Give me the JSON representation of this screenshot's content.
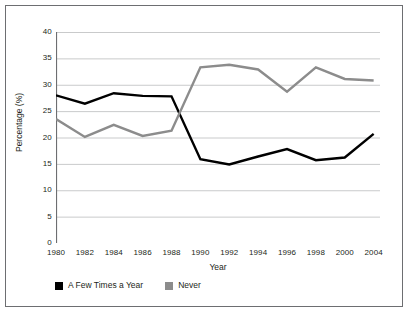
{
  "chart_data": {
    "type": "line",
    "title": "",
    "xlabel": "Year",
    "ylabel": "Percentage (%)",
    "x": [
      1980,
      1982,
      1984,
      1986,
      1988,
      1990,
      1992,
      1994,
      1996,
      1998,
      2000,
      2004
    ],
    "xticklabels": [
      "1980",
      "1982",
      "1984",
      "1986",
      "1988",
      "1990",
      "1992",
      "1994",
      "1996",
      "1998",
      "2000",
      "2004"
    ],
    "yticklabels": [
      "0",
      "5",
      "10",
      "15",
      "20",
      "25",
      "30",
      "35",
      "40"
    ],
    "yticks": [
      0,
      5,
      10,
      15,
      20,
      25,
      30,
      35,
      40
    ],
    "ylim": [
      0,
      40
    ],
    "grid": "horizontal",
    "legend_position": "below-axis-left",
    "series": [
      {
        "name": "A Few Times a Year",
        "color": "#000000",
        "values": [
          28.0,
          26.4,
          28.4,
          27.9,
          27.8,
          15.9,
          14.9,
          16.4,
          17.8,
          15.7,
          16.2,
          20.7
        ]
      },
      {
        "name": "Never",
        "color": "#8c8c8c",
        "values": [
          23.5,
          20.1,
          22.4,
          20.3,
          21.3,
          33.3,
          33.8,
          32.9,
          28.7,
          33.3,
          31.1,
          30.8
        ]
      }
    ]
  },
  "legend": {
    "items": [
      {
        "label": "A Few Times a Year",
        "color": "#000000"
      },
      {
        "label": "Never",
        "color": "#8c8c8c"
      }
    ]
  },
  "style": {
    "gridline_color": "#c9cacb",
    "axis_color": "#6d6e71",
    "frame_color": "#6d6e71",
    "background": "#ffffff",
    "text_color": "#231f20"
  }
}
